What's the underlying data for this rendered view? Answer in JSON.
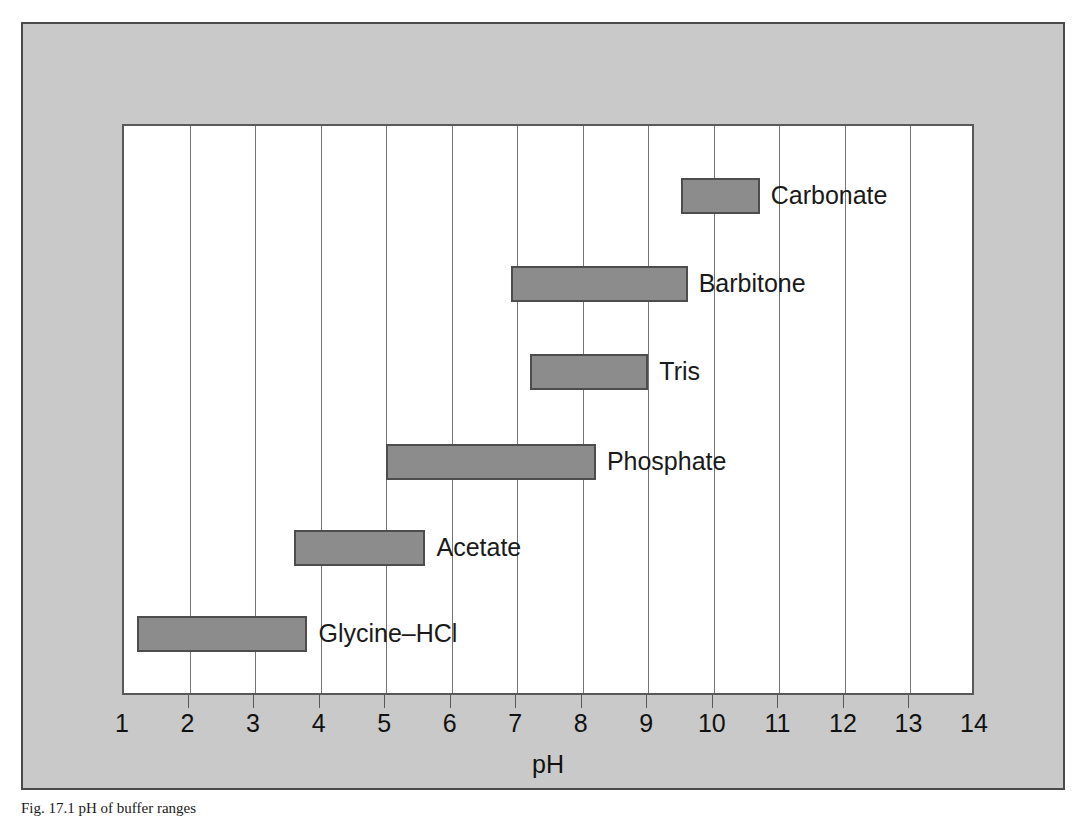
{
  "figure": {
    "caption": "Fig. 17.1 pH of buffer ranges",
    "background_color": "#c9c9c9",
    "plot_background_color": "#ffffff",
    "bar_fill_color": "#8c8c8c",
    "bar_border_color": "#4d4d4d",
    "gridline_color": "#767676",
    "axis_color": "#595959"
  },
  "chart_data": {
    "type": "bar",
    "orientation": "horizontal",
    "title": "",
    "subtitle": "",
    "xlabel": "pH",
    "ylabel": "",
    "xlim": [
      1,
      14
    ],
    "ylim": [
      0,
      6
    ],
    "grid": true,
    "legend": false,
    "legend_position": "none",
    "xticks": [
      1,
      2,
      3,
      4,
      5,
      6,
      7,
      8,
      9,
      10,
      11,
      12,
      13,
      14
    ],
    "xtick_labels": [
      "1",
      "2",
      "3",
      "4",
      "5",
      "6",
      "7",
      "8",
      "9",
      "10",
      "11",
      "12",
      "13",
      "14"
    ],
    "categories": [
      "Carbonate",
      "Barbitone",
      "Tris",
      "Phosphate",
      "Acetate",
      "Glycine–HCl"
    ],
    "ranges": [
      {
        "name": "Carbonate",
        "start": 9.5,
        "end": 10.7,
        "label": "Carbonate"
      },
      {
        "name": "Barbitone",
        "start": 6.9,
        "end": 9.6,
        "label": "Barbitone"
      },
      {
        "name": "Tris",
        "start": 7.2,
        "end": 9.0,
        "label": "Tris"
      },
      {
        "name": "Phosphate",
        "start": 5.0,
        "end": 8.2,
        "label": "Phosphate"
      },
      {
        "name": "Acetate",
        "start": 3.6,
        "end": 5.6,
        "label": "Acetate"
      },
      {
        "name": "Glycine–HCl",
        "start": 1.2,
        "end": 3.8,
        "label": "Glycine–HCl"
      }
    ],
    "annotations": []
  }
}
